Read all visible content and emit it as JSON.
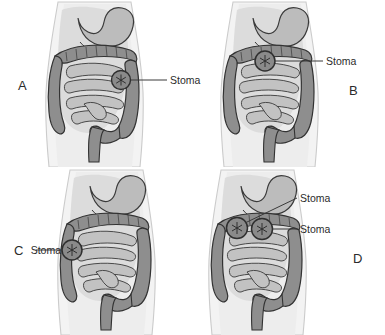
{
  "figure": {
    "background_color": "#ffffff",
    "label_color": "#2b2b2b",
    "colors": {
      "body_fill": "#f2f2f2",
      "body_outline": "#c9c9c9",
      "stomach_fill": "#b9b9b9",
      "colon_fill": "#8e8e8e",
      "small_intestine_fill": "#bdbdbd",
      "organ_outline": "#3a3a3a",
      "stoma_marker": "#6f6f6f",
      "leader_line": "#3a3a3a"
    }
  },
  "panels": [
    {
      "id": "panel-a",
      "letter": "A",
      "letter_position": "left",
      "description": "Ileostomy - stoma on right lower abdomen at terminal ileum",
      "stomas": [
        {
          "label": "Stoma",
          "marker_name": "stoma-marker",
          "label_side": "right"
        }
      ]
    },
    {
      "id": "panel-b",
      "letter": "B",
      "letter_position": "right",
      "description": "Transverse colostomy - stoma at transverse colon",
      "stomas": [
        {
          "label": "Stoma",
          "marker_name": "stoma-marker",
          "label_side": "right"
        }
      ]
    },
    {
      "id": "panel-c",
      "letter": "C",
      "letter_position": "left",
      "description": "Ascending colostomy - stoma on right side at ascending colon",
      "stomas": [
        {
          "label": "Stoma",
          "marker_name": "stoma-marker",
          "label_side": "left"
        }
      ]
    },
    {
      "id": "panel-d",
      "letter": "D",
      "letter_position": "right",
      "description": "Double-barrel stoma - two stomas at transverse colon",
      "stomas": [
        {
          "label": "Stoma",
          "marker_name": "stoma-marker-upper",
          "label_side": "right"
        },
        {
          "label": "Stoma",
          "marker_name": "stoma-marker-lower",
          "label_side": "right"
        }
      ]
    }
  ]
}
